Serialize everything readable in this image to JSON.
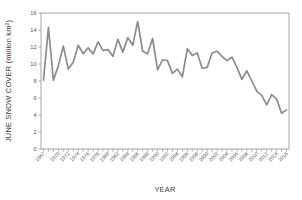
{
  "chart_data": {
    "type": "line",
    "title": "",
    "xlabel": "YEAR",
    "ylabel": "JUNE SNOW COVER (million km²)",
    "xlim": [
      1966.5,
      2016.5
    ],
    "ylim": [
      0,
      16
    ],
    "grid": false,
    "legend": false,
    "line_color": "#8c8c8c",
    "axis_color": "#9b9b9b",
    "y_ticks": [
      0,
      2,
      4,
      6,
      8,
      10,
      12,
      14,
      16
    ],
    "y_tick_labels": [
      "0",
      "2",
      "4",
      "6",
      "8",
      "10",
      "12",
      "14",
      "16"
    ],
    "x_tick_labels": [
      "1967",
      "1970",
      "1972",
      "1974",
      "1976",
      "1978",
      "1980",
      "1982",
      "1984",
      "1986",
      "1988",
      "1990",
      "1992",
      "1994",
      "1996",
      "1998",
      "2000",
      "2002",
      "2004",
      "2006",
      "2008",
      "2010",
      "2012",
      "2014",
      "2016"
    ],
    "x_tick_years": [
      1967,
      1970,
      1972,
      1974,
      1976,
      1978,
      1980,
      1982,
      1984,
      1986,
      1988,
      1990,
      1992,
      1994,
      1996,
      1998,
      2000,
      2002,
      2004,
      2006,
      2008,
      2010,
      2012,
      2014,
      2016
    ],
    "x_minor_tick_years": [
      1967,
      1968,
      1969,
      1970,
      1971,
      1972,
      1973,
      1974,
      1975,
      1976,
      1977,
      1978,
      1979,
      1980,
      1981,
      1982,
      1983,
      1984,
      1985,
      1986,
      1987,
      1988,
      1989,
      1990,
      1991,
      1992,
      1993,
      1994,
      1995,
      1996,
      1997,
      1998,
      1999,
      2000,
      2001,
      2002,
      2003,
      2004,
      2005,
      2006,
      2007,
      2008,
      2009,
      2010,
      2011,
      2012,
      2013,
      2014,
      2015,
      2016
    ],
    "x": [
      1967,
      1968,
      1969,
      1970,
      1971,
      1972,
      1973,
      1974,
      1975,
      1976,
      1977,
      1978,
      1979,
      1980,
      1981,
      1982,
      1983,
      1984,
      1985,
      1986,
      1987,
      1988,
      1989,
      1990,
      1991,
      1992,
      1993,
      1994,
      1995,
      1996,
      1997,
      1998,
      1999,
      2000,
      2001,
      2002,
      2003,
      2004,
      2005,
      2006,
      2007,
      2008,
      2009,
      2010,
      2011,
      2012,
      2013,
      2014,
      2015,
      2016
    ],
    "values": [
      8.1,
      14.3,
      8.1,
      9.8,
      12.1,
      9.4,
      10.2,
      12.2,
      11.2,
      11.9,
      11.2,
      12.6,
      11.6,
      11.7,
      10.9,
      12.9,
      11.4,
      13.1,
      12.2,
      15.0,
      11.5,
      11.2,
      13.0,
      9.3,
      10.5,
      10.4,
      8.9,
      9.4,
      8.5,
      11.8,
      11.0,
      11.3,
      9.5,
      9.6,
      11.3,
      11.5,
      10.9,
      10.4,
      10.8,
      9.6,
      8.2,
      9.2,
      8.0,
      6.8,
      6.3,
      5.2,
      6.4,
      5.9,
      4.2,
      4.6
    ]
  }
}
